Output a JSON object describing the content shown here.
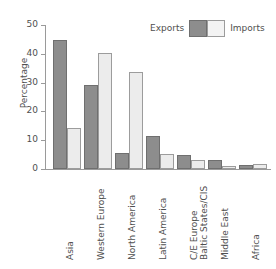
{
  "chart_data": {
    "type": "bar",
    "title": "",
    "xlabel": "",
    "ylabel": "Percentage",
    "ylim": [
      0,
      50
    ],
    "yticks": [
      0,
      10,
      20,
      30,
      40,
      50
    ],
    "grid": false,
    "legend_position": "top-right",
    "categories": [
      "Asia",
      "Western Europe",
      "North America",
      "Latin America",
      "C/E Europe\nBaltic States/CIS",
      "Middle East",
      "Africa"
    ],
    "category_lines": [
      [
        "Asia"
      ],
      [
        "Western Europe"
      ],
      [
        "North America"
      ],
      [
        "Latin America"
      ],
      [
        "C/E Europe",
        "Baltic States/CIS"
      ],
      [
        "Middle East"
      ],
      [
        "Africa"
      ]
    ],
    "series": [
      {
        "name": "Exports",
        "color": "#8d8d8d",
        "values": [
          44.9,
          29.0,
          5.5,
          11.4,
          4.7,
          3.2,
          1.4
        ]
      },
      {
        "name": "Imports",
        "color": "#ececec",
        "values": [
          14.2,
          40.3,
          33.7,
          5.1,
          3.2,
          1.1,
          1.8
        ]
      }
    ]
  },
  "legend": {
    "exports_label": "Exports",
    "imports_label": "Imports"
  },
  "axis": {
    "y_title": "Percentage",
    "tick_labels": [
      "50",
      "40",
      "30",
      "20",
      "10",
      "0"
    ]
  },
  "colors": {
    "exports_fill": "#8d8d8d",
    "exports_border": "#6f6f6f",
    "imports_fill": "#ececec",
    "imports_border": "#9c9c9c",
    "axis": "#9a9a9a",
    "text": "#4f4f4f",
    "background": "#ffffff"
  }
}
